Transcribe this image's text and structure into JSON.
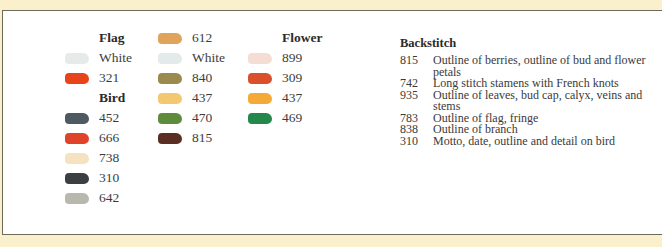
{
  "legend": {
    "flag": {
      "heading": "Flag",
      "items": [
        {
          "code": "White",
          "color": "#e6ebea"
        },
        {
          "code": "321",
          "color": "#e8441c"
        }
      ]
    },
    "bird": {
      "heading": "Bird",
      "items": [
        {
          "code": "452",
          "color": "#4d5a62"
        },
        {
          "code": "666",
          "color": "#e0432c"
        },
        {
          "code": "738",
          "color": "#f5e2c0"
        },
        {
          "code": "310",
          "color": "#3c3f42"
        },
        {
          "code": "642",
          "color": "#b8b8ae"
        }
      ]
    },
    "column_two": {
      "items": [
        {
          "code": "612",
          "color": "#dfa45a"
        },
        {
          "code": "White",
          "color": "#e3ebea"
        },
        {
          "code": "840",
          "color": "#9a8a4e"
        },
        {
          "code": "437",
          "color": "#f2c870"
        },
        {
          "code": "470",
          "color": "#5f8c3c"
        },
        {
          "code": "815",
          "color": "#5a2e22"
        }
      ]
    },
    "flower": {
      "heading": "Flower",
      "items": [
        {
          "code": "899",
          "color": "#f6ddd4"
        },
        {
          "code": "309",
          "color": "#d9502a"
        },
        {
          "code": "437",
          "color": "#f5a936"
        },
        {
          "code": "469",
          "color": "#24884a"
        }
      ]
    }
  },
  "backstitch": {
    "title": "Backstitch",
    "rows": [
      {
        "code": "815",
        "desc": "Outline of berries, outline of bud and flower petals"
      },
      {
        "code": "742",
        "desc": "Long stitch stamens with French knots"
      },
      {
        "code": "935",
        "desc": "Outline of leaves, bud cap, calyx, veins and stems"
      },
      {
        "code": "783",
        "desc": "Outline of flag, fringe"
      },
      {
        "code": "838",
        "desc": "Outline of branch"
      },
      {
        "code": "310",
        "desc": "Motto, date, outline and detail on bird"
      }
    ]
  }
}
